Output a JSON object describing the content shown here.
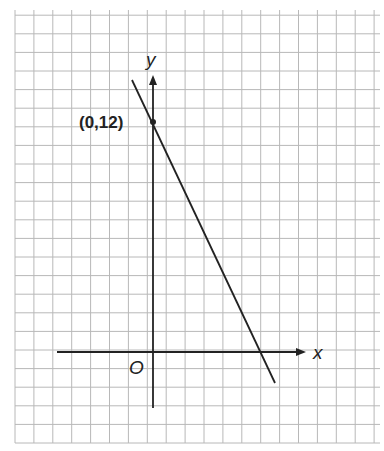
{
  "figure": {
    "colors": {
      "grid": "#b8b8b8",
      "axes": "#222222",
      "line": "#222222",
      "background": "#ffffff"
    },
    "grid": {
      "left": 15,
      "top": 10,
      "right": 380,
      "bottom": 443,
      "spacing_x": 18.9,
      "spacing_y": 18.6
    },
    "axes": {
      "origin_px": [
        153,
        352
      ],
      "x_axis": {
        "from": [
          57,
          352
        ],
        "to": [
          306,
          352
        ],
        "label": "x"
      },
      "y_axis": {
        "from": [
          153,
          408
        ],
        "to": [
          153,
          75
        ],
        "label": "y"
      },
      "origin_label": "O"
    },
    "line": {
      "from_px": [
        132,
        80
      ],
      "to_px": [
        275,
        383
      ]
    },
    "points": [
      {
        "label": "(0,12)",
        "px": [
          153,
          122
        ]
      }
    ]
  }
}
